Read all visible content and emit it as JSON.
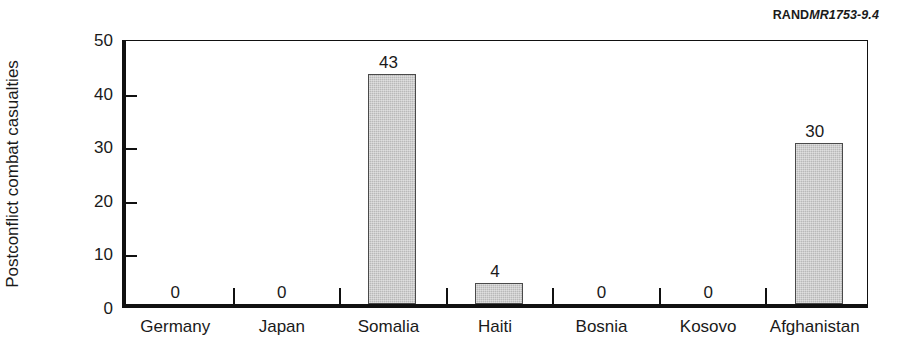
{
  "source_tag": {
    "brand": "RAND",
    "code": "MR1753-9.4"
  },
  "chart_data": {
    "type": "bar",
    "title": "",
    "xlabel": "",
    "ylabel": "Postconflict combat casualties",
    "categories": [
      "Germany",
      "Japan",
      "Somalia",
      "Haiti",
      "Bosnia",
      "Kosovo",
      "Afghanistan"
    ],
    "values": [
      0,
      0,
      43,
      4,
      0,
      0,
      30
    ],
    "value_labels": [
      "0",
      "0",
      "43",
      "4",
      "0",
      "0",
      "30"
    ],
    "ylim": [
      0,
      50
    ],
    "yticks": [
      0,
      10,
      20,
      30,
      40,
      50
    ],
    "ytick_labels": [
      "0",
      "10",
      "20",
      "30",
      "40",
      "50"
    ],
    "grid": false,
    "legend": null,
    "bar_color": "#b9b9b9",
    "bar_edge_color": "#4a4a4a",
    "axis_color": "#111111"
  }
}
